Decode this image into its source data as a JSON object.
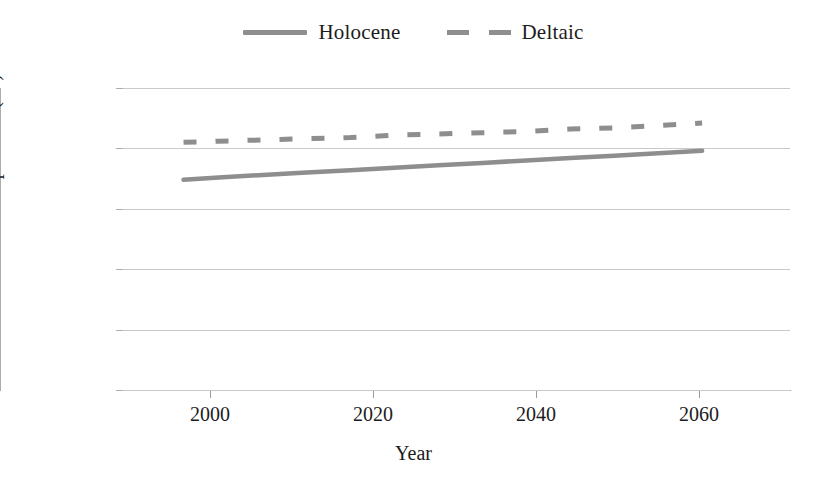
{
  "legend": {
    "position": "top-center",
    "entries": [
      {
        "label": "Holocene",
        "style": "solid",
        "color": "#8e8e8e",
        "swatch": "solid-line-swatch"
      },
      {
        "label": "Deltaic",
        "style": "dashed",
        "color": "#8e8e8e",
        "swatch": "dashed-line-swatch"
      }
    ]
  },
  "axes": {
    "y": {
      "title": "Mean annual temperature (°C)",
      "ticks": [
        "0",
        "5",
        "10",
        "15",
        "20",
        "25"
      ]
    },
    "x": {
      "title": "Year",
      "ticks": [
        "2000",
        "2020",
        "2040",
        "2060"
      ]
    }
  },
  "chart_data": {
    "type": "line",
    "title": "",
    "subtitle": "",
    "xlabel": "Year",
    "ylabel": "Mean annual temperature (°C)",
    "xlim": [
      1994,
      2070
    ],
    "ylim": [
      0,
      25
    ],
    "xticks": [
      2000,
      2020,
      2040,
      2060
    ],
    "yticks": [
      0,
      5,
      10,
      15,
      20,
      25
    ],
    "grid": "horizontal",
    "legend_position": "top-center",
    "x": [
      2001,
      2005,
      2010,
      2015,
      2020,
      2025,
      2030,
      2035,
      2040,
      2045,
      2050,
      2055,
      2060
    ],
    "series": [
      {
        "name": "Holocene",
        "style": "solid",
        "color": "#8e8e8e",
        "values": [
          17.4,
          17.6,
          17.8,
          18.0,
          18.2,
          18.4,
          18.6,
          18.8,
          19.0,
          19.2,
          19.4,
          19.6,
          19.8
        ]
      },
      {
        "name": "Deltaic",
        "style": "dashed",
        "color": "#8e8e8e",
        "values": [
          20.5,
          20.6,
          20.7,
          20.8,
          20.9,
          21.1,
          21.2,
          21.3,
          21.4,
          21.6,
          21.7,
          21.9,
          22.1
        ]
      }
    ]
  },
  "colors": {
    "series": "#8e8e8e",
    "gridline": "#c9c9c9",
    "axis": "#adadad",
    "text": "#1c1c1c",
    "background": "#ffffff"
  }
}
